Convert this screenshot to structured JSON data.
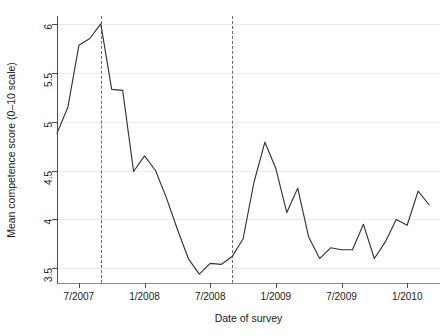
{
  "chart_data": {
    "type": "line",
    "title": "",
    "xlabel": "Date of survey",
    "ylabel": "Mean competence score (0–10 scale)",
    "ylim": [
      3.35,
      6.08
    ],
    "yticks": [
      3.5,
      4,
      4.5,
      5,
      5.5,
      6
    ],
    "ytick_labels": [
      "3.5",
      "4",
      "4.5",
      "5",
      "5.5",
      "6"
    ],
    "xlim": [
      "5/2007",
      "4/2010"
    ],
    "xticks": [
      "7/2007",
      "1/2008",
      "7/2008",
      "1/2009",
      "7/2009",
      "1/2010"
    ],
    "xtick_labels": [
      "7/2007",
      "1/2008",
      "7/2008",
      "1/2009",
      "7/2009",
      "1/2010"
    ],
    "grid": "horizontal",
    "legend": "none",
    "line_color": "#333333",
    "grid_color": "#ebebeb",
    "axis_color": "#4d4d4d",
    "annotations": [
      {
        "type": "vertical-dashed-line",
        "x": "9/2007",
        "style": "dashed",
        "color": "#6b6b6b"
      },
      {
        "type": "vertical-dashed-line",
        "x": "9/2008",
        "style": "dashed",
        "color": "#6b6b6b"
      }
    ],
    "series": [
      {
        "name": "Mean competence score",
        "x": [
          "5/2007",
          "6/2007",
          "7/2007",
          "8/2007",
          "9/2007",
          "10/2007",
          "11/2007",
          "12/2007",
          "1/2008",
          "2/2008",
          "3/2008",
          "4/2008",
          "5/2008",
          "6/2008",
          "7/2008",
          "8/2008",
          "9/2008",
          "10/2008",
          "11/2008",
          "12/2008",
          "1/2009",
          "2/2009",
          "3/2009",
          "4/2009",
          "5/2009",
          "6/2009",
          "7/2009",
          "8/2009",
          "9/2009",
          "10/2009",
          "11/2009",
          "12/2009",
          "1/2010",
          "2/2010",
          "3/2010"
        ],
        "values": [
          4.88,
          5.15,
          5.78,
          5.85,
          6.0,
          5.33,
          5.32,
          4.49,
          4.65,
          4.5,
          4.22,
          3.9,
          3.6,
          3.44,
          3.55,
          3.54,
          3.62,
          3.8,
          4.38,
          4.79,
          4.52,
          4.07,
          4.32,
          3.82,
          3.6,
          3.71,
          3.69,
          3.69,
          3.95,
          3.6,
          3.77,
          4.0,
          3.94,
          4.29,
          4.15
        ]
      }
    ]
  }
}
